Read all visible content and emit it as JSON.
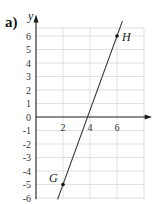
{
  "part_label": "a)",
  "chart_data": {
    "type": "line",
    "title": "",
    "xlabel": "x",
    "ylabel": "y",
    "xlim": [
      0,
      8
    ],
    "ylim": [
      -6,
      7
    ],
    "grid": true,
    "x_ticks": [
      "2",
      "4",
      "6"
    ],
    "y_ticks": [
      "6",
      "5",
      "4",
      "3",
      "2",
      "1",
      "0",
      "-1",
      "-2",
      "-3",
      "-4",
      "-5",
      "-6"
    ],
    "series": [
      {
        "name": "line GH",
        "x": [
          1.6,
          6.4
        ],
        "y": [
          -6.1,
          7.1
        ]
      }
    ],
    "points": [
      {
        "label": "G",
        "x": 2,
        "y": -5
      },
      {
        "label": "H",
        "x": 6,
        "y": 6
      }
    ],
    "colors": {
      "line": "#333333",
      "grid": "#d9d9d9",
      "axis": "#1a1a1a"
    }
  }
}
